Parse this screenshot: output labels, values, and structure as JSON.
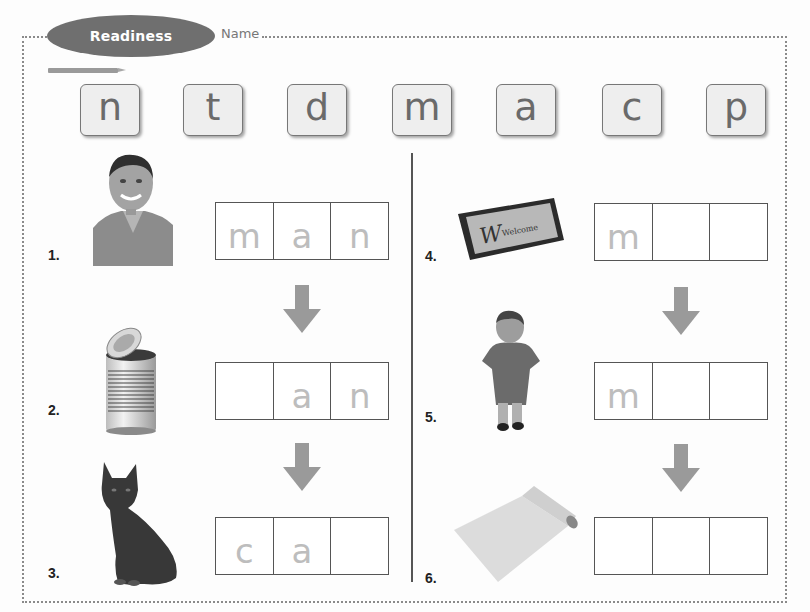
{
  "header": {
    "badge_label": "Readiness",
    "name_label": "Name"
  },
  "letter_tiles": [
    "n",
    "t",
    "d",
    "m",
    "a",
    "c",
    "p"
  ],
  "colors": {
    "badge": "#6f6f6f",
    "tile_bg": "#eeeeee",
    "tile_text": "#6a6a6a",
    "hint_letter": "#bdbdbd",
    "arrow": "#9a9a9a",
    "divider": "#555555"
  },
  "exercises": {
    "left": [
      {
        "number": "1.",
        "picture": "man-photo",
        "cells": [
          "m",
          "a",
          "n"
        ]
      },
      {
        "number": "2.",
        "picture": "can-photo",
        "cells": [
          "",
          "a",
          "n"
        ]
      },
      {
        "number": "3.",
        "picture": "cat-photo",
        "cells": [
          "c",
          "a",
          ""
        ]
      }
    ],
    "right": [
      {
        "number": "4.",
        "picture": "welcome-mat-photo",
        "cells": [
          "m",
          "",
          ""
        ],
        "mat_text": "Welcome"
      },
      {
        "number": "5.",
        "picture": "boy-photo",
        "cells": [
          "m",
          "",
          ""
        ]
      },
      {
        "number": "6.",
        "picture": "mat-roll-photo",
        "cells": [
          "",
          "",
          ""
        ]
      }
    ]
  }
}
